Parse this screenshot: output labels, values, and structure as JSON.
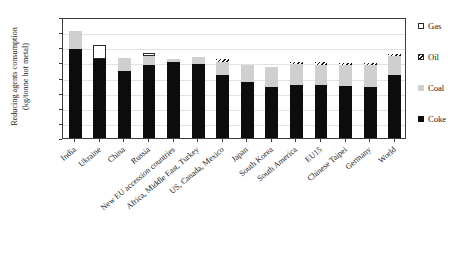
{
  "chart_data": {
    "type": "bar",
    "subtype": "stacked-vertical",
    "title": "",
    "xlabel": "",
    "ylabel": "Reducing agents consumption (kg/tonne hot metal)",
    "ylabel_lines": [
      "Reducing agents consumption",
      "(kg/tonne hot metal)"
    ],
    "ylim": [
      0,
      800
    ],
    "yticks": [
      0,
      100,
      200,
      300,
      400,
      500,
      600,
      700,
      800
    ],
    "grid": true,
    "grid_axis": "y",
    "legend_position": "right",
    "categories": [
      "India",
      "Ukraine",
      "China",
      "Russia",
      "New EU accession countries",
      "Africa, Middle East, Turkey",
      "US, Canada, Mexico",
      "Japan",
      "South Korea",
      "South America",
      "EU15",
      "Chinese Taipei",
      "Germany",
      "World"
    ],
    "series": [
      {
        "name": "Coke",
        "color": "#0d0d0d",
        "values": [
          590,
          520,
          440,
          480,
          505,
          490,
          415,
          368,
          340,
          350,
          350,
          345,
          340,
          415
        ]
      },
      {
        "name": "Coal",
        "color": "#cfcfcf",
        "values": [
          115,
          0,
          90,
          60,
          15,
          45,
          85,
          112,
          130,
          142,
          135,
          135,
          140,
          130
        ]
      },
      {
        "name": "Oil",
        "color": "#ffffff",
        "pattern": "hatched",
        "values": [
          0,
          0,
          0,
          0,
          0,
          0,
          20,
          0,
          0,
          10,
          15,
          14,
          18,
          12
        ]
      },
      {
        "name": "Gas",
        "color": "#ffffff",
        "pattern": "open",
        "values": [
          0,
          95,
          0,
          25,
          0,
          0,
          0,
          0,
          0,
          0,
          0,
          0,
          0,
          0
        ]
      }
    ],
    "totals": [
      705,
      615,
      530,
      565,
      520,
      535,
      520,
      480,
      470,
      502,
      500,
      494,
      498,
      557
    ],
    "stack_order": [
      "Coke",
      "Coal",
      "Oil",
      "Gas"
    ],
    "legend": [
      {
        "label": "Gas",
        "swatch": "gas"
      },
      {
        "label": "Oil",
        "swatch": "oil"
      },
      {
        "label": "Coal",
        "swatch": "coal"
      },
      {
        "label": "Coke",
        "swatch": "coke"
      }
    ]
  }
}
